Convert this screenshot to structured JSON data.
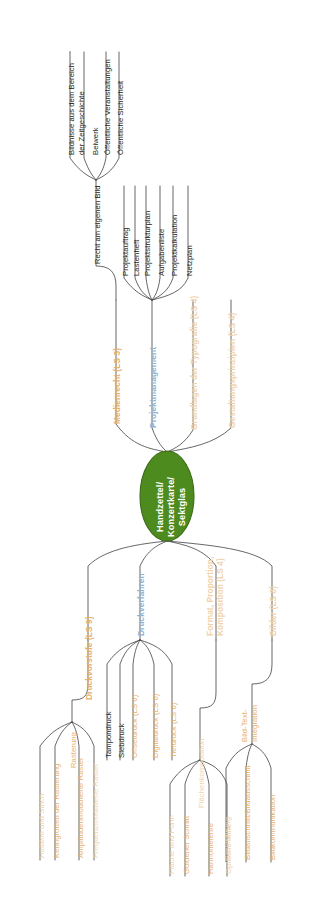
{
  "diagram": {
    "type": "mind-map",
    "orientation": "rotated-90-ccw",
    "colors": {
      "root_fill": "#4e8b1f",
      "root_text": "#ffffff",
      "branch_orange": "#e8b06a",
      "branch_orange_pale": "#f0d3ac",
      "branch_blue": "#8fb4d4",
      "leaf_black": "#231f20",
      "line": "#3f4043",
      "background": "#ffffff"
    },
    "root": {
      "label": "Handzettel/\nKonzertkarte/\nSektglas"
    },
    "branches": [
      {
        "id": "medienrecht",
        "label": "Medienrecht (LS 3)",
        "color": "branch_orange",
        "side": "top",
        "children": [
          {
            "label": "Recht am eigenen Bild",
            "color": "leaf_black",
            "children": [
              {
                "label": "Bildnisse aus dem Bereich",
                "label2": "der Zeitgeschichte",
                "color": "leaf_black"
              },
              {
                "label": "Beiwerk",
                "color": "leaf_black"
              },
              {
                "label": "Öffentliche Veranstaltungen",
                "color": "leaf_black"
              },
              {
                "label": "Öffentliche Sicherheit",
                "color": "leaf_black"
              }
            ]
          }
        ]
      },
      {
        "id": "projektmanagement",
        "label": "Projektmanagement",
        "color": "branch_blue",
        "side": "top",
        "children": [
          {
            "label": "Projektauftrag",
            "color": "leaf_black"
          },
          {
            "label": "Lastenheft",
            "color": "leaf_black"
          },
          {
            "label": "Projektstrukturplan",
            "color": "leaf_black"
          },
          {
            "label": "Aufgabenliste",
            "color": "leaf_black"
          },
          {
            "label": "Projektkalkulation",
            "color": "leaf_black"
          },
          {
            "label": "Netzplan",
            "color": "leaf_black"
          }
        ]
      },
      {
        "id": "typografie",
        "label": "Grundlagen der Typografie (LS 4)",
        "color": "branch_orange_pale",
        "side": "top",
        "children": []
      },
      {
        "id": "gestaltungsprinzipien",
        "label": "Gestaltungsprinzipien (LS 4)",
        "color": "branch_orange_pale",
        "side": "top",
        "children": []
      },
      {
        "id": "druckvorstufe",
        "label": "Druckvorstufe (LS 9)",
        "color": "branch_orange",
        "side": "bottom",
        "children": [
          {
            "label": "Rasterung",
            "color": "branch_orange",
            "children": [
              {
                "label": "Halbton und Strich",
                "color": "branch_orange"
              },
              {
                "label": "Kenngrößen der Rasterung",
                "color": "branch_orange"
              },
              {
                "label": "Amplitudenmodulierte Raster",
                "color": "branch_orange"
              },
              {
                "label": "Frequenzmodulierte Raster",
                "color": "branch_orange_pale"
              }
            ]
          }
        ]
      },
      {
        "id": "druckverfahren",
        "label": "Druckverfahren",
        "color": "branch_blue",
        "side": "bottom",
        "children": [
          {
            "label": "Tampondruck",
            "color": "leaf_black"
          },
          {
            "label": "Siebdruck",
            "color": "leaf_black"
          },
          {
            "label": "Offsetdruck (LS 6)",
            "color": "branch_orange"
          },
          {
            "label": "Digitaldruck (LS 6)",
            "color": "branch_orange"
          },
          {
            "label": "Tiefdruck (LS 6)",
            "color": "branch_orange"
          }
        ]
      },
      {
        "id": "format-proportion",
        "label": "Format, Proportion,",
        "label2": "Komposition (LS 4)",
        "color": "branch_orange_pale",
        "side": "bottom",
        "children": [
          {
            "label": "Flächenkomposition",
            "color": "branch_orange_pale",
            "children": [
              {
                "label": "Fläche und Form",
                "color": "branch_orange_pale"
              },
              {
                "label": "Goldener Schnitt",
                "color": "branch_orange"
              },
              {
                "label": "Harmonielehre",
                "color": "branch_orange"
              },
              {
                "label": "Optische Mitte",
                "color": "branch_orange_pale"
              }
            ]
          }
        ]
      },
      {
        "id": "bilder",
        "label": "Bilder (LS 8)",
        "color": "branch_orange_pale",
        "side": "bottom",
        "children": [
          {
            "label": "Bild-Text-",
            "label2": "Integration",
            "color": "branch_orange",
            "children": [
              {
                "label": "Blickführung",
                "color": "branch_orange_pale"
              },
              {
                "label": "Bildanschnitt/Bildausschnitt",
                "color": "branch_orange"
              },
              {
                "label": "Bildkommunikation",
                "color": "branch_orange"
              }
            ]
          }
        ]
      }
    ]
  }
}
